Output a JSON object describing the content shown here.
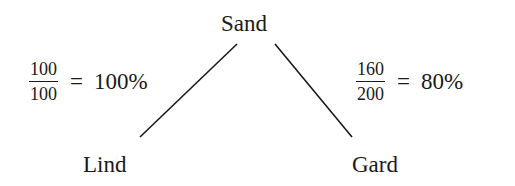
{
  "diagram": {
    "nodes": {
      "root": "Sand",
      "left_child": "Lind",
      "right_child": "Gard"
    },
    "edges": [
      {
        "from": "Sand",
        "to": "Lind"
      },
      {
        "from": "Sand",
        "to": "Gard"
      }
    ],
    "ratios": {
      "left": {
        "numerator": "100",
        "denominator": "100",
        "equals": "=",
        "result": "100%"
      },
      "right": {
        "numerator": "160",
        "denominator": "200",
        "equals": "=",
        "result": "80%"
      }
    }
  }
}
